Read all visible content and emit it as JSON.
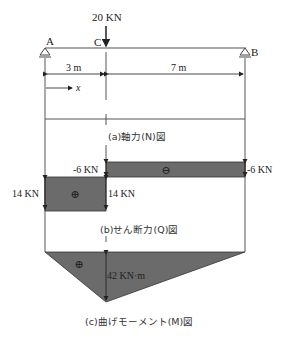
{
  "diagram": {
    "load": {
      "label": "20 KN"
    },
    "points": {
      "A": "A",
      "B": "B",
      "C": "C"
    },
    "spans": [
      {
        "label": "3 m",
        "length": 3
      },
      {
        "label": "7 m",
        "length": 7
      }
    ],
    "x_axis_label": "x",
    "captions": {
      "axial": "(a)軸力(N)図",
      "shear": "(b)せん断力(Q)図",
      "moment": "(c)曲げモーメント(M)図"
    },
    "shear": {
      "positive_symbol": "⊕",
      "negative_symbol": "⊖",
      "labels": {
        "left_value": "14 KN",
        "c_positive": "14 KN",
        "c_negative": "-6 KN",
        "right_value": "-6 KN"
      },
      "values": [
        {
          "segment": "A-C",
          "value": 14
        },
        {
          "segment": "C-B",
          "value": -6
        }
      ]
    },
    "moment": {
      "positive_symbol": "⊕",
      "max_label": "42 KN·m",
      "max_value": 42,
      "max_at": "C"
    },
    "colors": {
      "fill": "#6b6b6b",
      "line": "#333333",
      "text": "#222222"
    }
  }
}
